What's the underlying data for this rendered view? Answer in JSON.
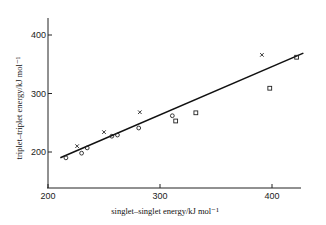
{
  "chart_data": {
    "type": "scatter",
    "title": "",
    "xlabel": "singlet–singlet energy/kJ mol⁻¹",
    "ylabel": "triplet–triplet energy/kJ mol⁻¹",
    "xlim": [
      200,
      435
    ],
    "ylim": [
      140,
      435
    ],
    "xticks": [
      200,
      300,
      400
    ],
    "yticks": [
      200,
      300,
      400
    ],
    "grid": false,
    "legend": null,
    "series": [
      {
        "name": "circles",
        "marker": "o",
        "points": [
          [
            216,
            190
          ],
          [
            230,
            198
          ],
          [
            235,
            207
          ],
          [
            257,
            227
          ],
          [
            262,
            229
          ],
          [
            281,
            241
          ],
          [
            311,
            262
          ]
        ]
      },
      {
        "name": "crosses",
        "marker": "x",
        "points": [
          [
            226,
            210
          ],
          [
            250,
            234
          ],
          [
            282,
            268
          ],
          [
            391,
            366
          ]
        ]
      },
      {
        "name": "squares",
        "marker": "square",
        "points": [
          [
            314,
            253
          ],
          [
            332,
            267
          ],
          [
            398,
            309
          ],
          [
            422,
            362
          ]
        ]
      }
    ],
    "fit_line": {
      "from": [
        211,
        190
      ],
      "to": [
        428,
        369
      ]
    }
  }
}
